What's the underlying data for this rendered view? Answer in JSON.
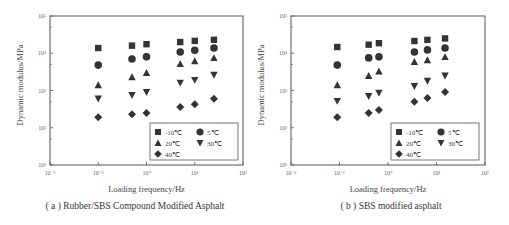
{
  "chart_data": [
    {
      "type": "scatter",
      "title": "(a) Rubber/SBS Compound Modified Asphalt",
      "xlabel": "Loading frequency/Hz",
      "ylabel": "Dynamic modulus/MPa",
      "xscale": "log",
      "yscale": "log",
      "xlim": [
        0.01,
        100
      ],
      "ylim": [
        10,
        100000
      ],
      "xticks": [
        "10⁻²",
        "10⁻¹",
        "10⁰",
        "10¹",
        "10²"
      ],
      "yticks": [
        "10¹",
        "10²",
        "10³",
        "10⁴",
        "10⁵"
      ],
      "grid": false,
      "legend_position": "lower right",
      "x": [
        0.1,
        0.5,
        1,
        5,
        10,
        25
      ],
      "series": [
        {
          "name": "-10℃",
          "marker": "square",
          "values": [
            13800,
            16000,
            17500,
            20000,
            21500,
            23000
          ]
        },
        {
          "name": "5℃",
          "marker": "circle",
          "values": [
            4800,
            7000,
            8000,
            10800,
            12000,
            13800
          ]
        },
        {
          "name": "20℃",
          "marker": "triangle-up",
          "values": [
            1400,
            2300,
            3000,
            5200,
            6200,
            7500
          ]
        },
        {
          "name": "30℃",
          "marker": "triangle-down",
          "values": [
            600,
            750,
            900,
            1600,
            1900,
            2600
          ]
        },
        {
          "name": "40℃",
          "marker": "diamond",
          "values": [
            190,
            230,
            250,
            360,
            430,
            600
          ]
        }
      ]
    },
    {
      "type": "scatter",
      "title": "(b) SBS modified asphalt",
      "xlabel": "Loading frequency/Hz",
      "ylabel": "Dynamic modulus/MPa",
      "xscale": "log",
      "yscale": "log",
      "xlim": [
        0.01,
        100
      ],
      "ylim": [
        10,
        100000
      ],
      "xticks": [
        "10⁻²",
        "10⁻¹",
        "10⁰",
        "10¹",
        "10²"
      ],
      "yticks": [
        "10¹",
        "10²",
        "10³",
        "10⁴",
        "10⁵"
      ],
      "grid": false,
      "legend_position": "lower right",
      "x": [
        0.09,
        0.4,
        0.65,
        3.5,
        6.5,
        15
      ],
      "series": [
        {
          "name": "-10℃",
          "marker": "square",
          "values": [
            14700,
            17000,
            18600,
            21300,
            22900,
            25000
          ]
        },
        {
          "name": "5℃",
          "marker": "circle",
          "values": [
            4800,
            7500,
            8000,
            10800,
            12300,
            13800
          ]
        },
        {
          "name": "20℃",
          "marker": "triangle-up",
          "values": [
            1400,
            2500,
            3300,
            5900,
            6600,
            8000
          ]
        },
        {
          "name": "30℃",
          "marker": "triangle-down",
          "values": [
            520,
            700,
            860,
            1300,
            1800,
            2500
          ]
        },
        {
          "name": "40℃",
          "marker": "diamond",
          "values": [
            190,
            250,
            300,
            500,
            630,
            910
          ]
        }
      ]
    }
  ],
  "panels": [
    {
      "caption": "( a ) Rubber/SBS Compound Modified Asphalt",
      "xlabel": "Loading frequency/Hz",
      "ylabel": "Dynamic modulus/MPa"
    },
    {
      "caption": "( b ) SBS modified asphalt",
      "xlabel": "Loading frequency/Hz",
      "ylabel": "Dynamic modulus/MPa"
    }
  ],
  "colors": {
    "marker": "#333333",
    "axis": "#555555",
    "text": "#444444"
  }
}
